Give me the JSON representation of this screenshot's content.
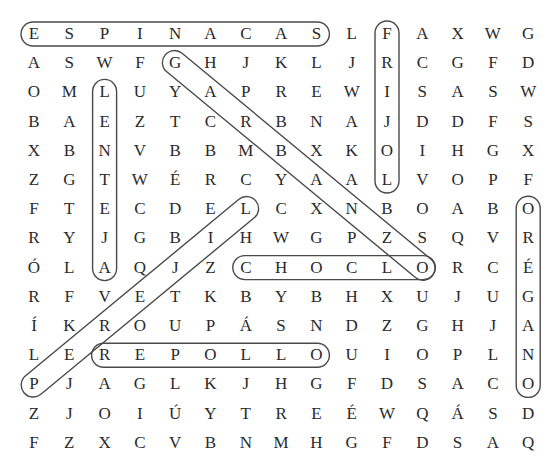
{
  "puzzle": {
    "type": "word-search",
    "columns": 15,
    "rows": 15,
    "grid": [
      [
        "E",
        "S",
        "P",
        "I",
        "N",
        "A",
        "C",
        "A",
        "S",
        "L",
        "F",
        "A",
        "X",
        "W",
        "G"
      ],
      [
        "A",
        "S",
        "W",
        "F",
        "G",
        "H",
        "J",
        "K",
        "L",
        "J",
        "R",
        "C",
        "G",
        "F",
        "D"
      ],
      [
        "O",
        "M",
        "L",
        "U",
        "Y",
        "A",
        "P",
        "R",
        "E",
        "W",
        "I",
        "S",
        "A",
        "S",
        "W"
      ],
      [
        "B",
        "A",
        "E",
        "Z",
        "T",
        "C",
        "R",
        "B",
        "N",
        "A",
        "J",
        "D",
        "D",
        "F",
        "S"
      ],
      [
        "X",
        "B",
        "N",
        "V",
        "B",
        "B",
        "M",
        "B",
        "X",
        "K",
        "O",
        "I",
        "H",
        "G",
        "X"
      ],
      [
        "Z",
        "G",
        "T",
        "W",
        "É",
        "R",
        "C",
        "Y",
        "A",
        "A",
        "L",
        "V",
        "O",
        "P",
        "F"
      ],
      [
        "F",
        "T",
        "E",
        "C",
        "D",
        "E",
        "L",
        "C",
        "X",
        "N",
        "B",
        "O",
        "A",
        "B",
        "O"
      ],
      [
        "R",
        "Y",
        "J",
        "G",
        "B",
        "I",
        "H",
        "W",
        "G",
        "P",
        "Z",
        "S",
        "Q",
        "V",
        "R"
      ],
      [
        "Ó",
        "L",
        "A",
        "Q",
        "J",
        "Z",
        "C",
        "H",
        "O",
        "C",
        "L",
        "O",
        "R",
        "C",
        "É"
      ],
      [
        "R",
        "F",
        "V",
        "E",
        "T",
        "K",
        "B",
        "Y",
        "B",
        "H",
        "X",
        "U",
        "J",
        "U",
        "G"
      ],
      [
        "Í",
        "K",
        "R",
        "O",
        "U",
        "P",
        "Á",
        "S",
        "N",
        "D",
        "Z",
        "G",
        "H",
        "J",
        "A"
      ],
      [
        "L",
        "E",
        "R",
        "E",
        "P",
        "O",
        "L",
        "L",
        "O",
        "U",
        "I",
        "O",
        "P",
        "L",
        "N"
      ],
      [
        "P",
        "J",
        "A",
        "G",
        "L",
        "K",
        "J",
        "H",
        "G",
        "F",
        "D",
        "S",
        "A",
        "C",
        "O"
      ],
      [
        "Z",
        "J",
        "O",
        "I",
        "Ú",
        "Y",
        "T",
        "R",
        "E",
        "É",
        "W",
        "Q",
        "Á",
        "S",
        "D"
      ],
      [
        "F",
        "Z",
        "X",
        "C",
        "V",
        "B",
        "N",
        "M",
        "H",
        "G",
        "F",
        "D",
        "S",
        "A",
        "Q"
      ]
    ],
    "found_words": [
      {
        "word": "ESPINACAS",
        "start": [
          0,
          0
        ],
        "end": [
          0,
          8
        ],
        "direction": "horizontal"
      },
      {
        "word": "FRIJOL",
        "start": [
          0,
          10
        ],
        "end": [
          5,
          10
        ],
        "direction": "vertical"
      },
      {
        "word": "LENTEJA",
        "start": [
          2,
          2
        ],
        "end": [
          8,
          2
        ],
        "direction": "vertical"
      },
      {
        "word": "GARBANZO",
        "start": [
          1,
          4
        ],
        "end": [
          8,
          11
        ],
        "direction": "diagonal-down"
      },
      {
        "word": "CHOCLO",
        "start": [
          8,
          6
        ],
        "end": [
          8,
          11
        ],
        "direction": "horizontal"
      },
      {
        "word": "ORÉGANO",
        "start": [
          6,
          14
        ],
        "end": [
          12,
          14
        ],
        "direction": "vertical"
      },
      {
        "word": "PEREJIL",
        "start": [
          12,
          0
        ],
        "end": [
          6,
          6
        ],
        "direction": "diagonal-up"
      },
      {
        "word": "REPOLLO",
        "start": [
          11,
          2
        ],
        "end": [
          11,
          8
        ],
        "direction": "horizontal"
      }
    ],
    "colors": {
      "text": "#2a2a2a",
      "circle": "#4a4a4a",
      "background": "#ffffff"
    }
  }
}
